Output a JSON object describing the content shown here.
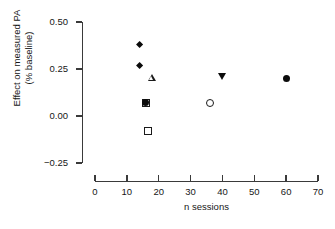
{
  "chart_data": {
    "type": "scatter",
    "title": "",
    "xlabel": "n sessions",
    "ylabel": "Effect on measured PA\n(% baseline)",
    "xlim": [
      0,
      70
    ],
    "ylim": [
      -0.25,
      0.5
    ],
    "grid": false,
    "legend": "none",
    "xticks": [
      "0",
      "10",
      "20",
      "30",
      "40",
      "50",
      "60",
      "70"
    ],
    "xtick_values": [
      0,
      10,
      20,
      30,
      40,
      50,
      60,
      70
    ],
    "yticks": [
      "0.50",
      "0.25",
      "0.00",
      "-0.25"
    ],
    "ytick_values": [
      0.5,
      0.25,
      0.0,
      -0.25
    ],
    "points": [
      {
        "x": 14,
        "y": 0.38,
        "marker": "diamond-filled"
      },
      {
        "x": 14,
        "y": 0.27,
        "marker": "diamond-filled"
      },
      {
        "x": 18,
        "y": 0.2,
        "marker": "triangle-up-open"
      },
      {
        "x": 16,
        "y": 0.07,
        "marker": "square-open"
      },
      {
        "x": 16,
        "y": 0.07,
        "marker": "circle-filled"
      },
      {
        "x": 16.5,
        "y": -0.08,
        "marker": "square-open"
      },
      {
        "x": 36,
        "y": 0.07,
        "marker": "circle-open"
      },
      {
        "x": 40,
        "y": 0.21,
        "marker": "triangle-down-filled"
      },
      {
        "x": 60,
        "y": 0.2,
        "marker": "circle-filled"
      }
    ],
    "colors": {
      "axis": "#3a3a3a",
      "text": "#161616",
      "marker_fill": "#0b0b0b",
      "marker_stroke": "#1a1a1a",
      "background": "#ffffff"
    }
  }
}
